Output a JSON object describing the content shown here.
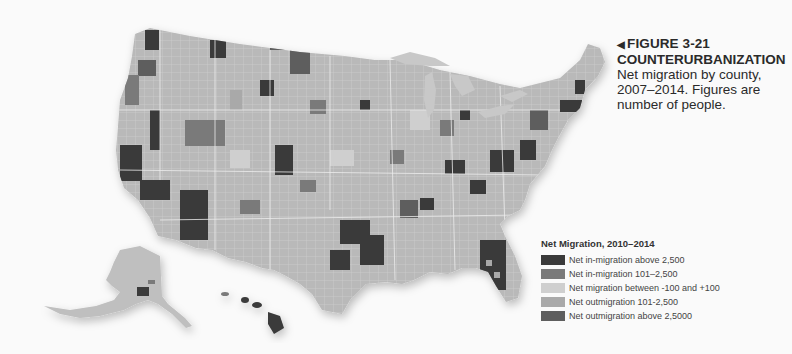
{
  "caption": {
    "marker": "◀",
    "figure_label": "FIGURE 3-21",
    "title": "COUNTERURBANIZATION",
    "description_lines": [
      "Net migration by county,",
      "2007–2014. Figures are",
      "number of people."
    ]
  },
  "legend": {
    "title": "Net Migration, 2010–2014",
    "items": [
      {
        "label": "Net in-migration above 2,500",
        "color": "#3a3a3a"
      },
      {
        "label": "Net in-migration 101–2,500",
        "color": "#7a7a7a"
      },
      {
        "label": "Net migration between -100 and +100",
        "color": "#cfcfcf"
      },
      {
        "label": "Net outmigration 101-2,500",
        "color": "#a9a9a9"
      },
      {
        "label": "Net outmigration above 2,5000",
        "color": "#5e5e5e"
      }
    ]
  },
  "map": {
    "subject": "United States counties choropleth",
    "regions": [
      "Contiguous United States",
      "Alaska",
      "Hawaii"
    ],
    "water_color": "#c8c8c8",
    "background_color": "#fafafa"
  }
}
